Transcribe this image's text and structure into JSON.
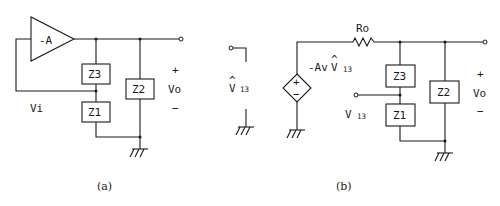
{
  "figure_a": {
    "caption": "(a)",
    "amplifier_label": "-A",
    "impedances": {
      "z3": "Z3",
      "z1": "Z1",
      "z2": "Z2"
    },
    "input_voltage_label": "Vi",
    "output": {
      "plus": "+",
      "label": "Vo",
      "minus": "−"
    }
  },
  "figure_b": {
    "caption": "(b)",
    "probe": {
      "hat": "^",
      "main": "V",
      "sub": "13"
    },
    "source": {
      "label_prefix": "-Av",
      "hat": "^",
      "main": "V",
      "sub": "13",
      "plus": "+",
      "minus": "−"
    },
    "resistor_label": "Ro",
    "impedances": {
      "z3": "Z3",
      "z1": "Z1",
      "z2": "Z2"
    },
    "node_label": {
      "main": "V",
      "sub": "13"
    },
    "output": {
      "plus": "+",
      "label": "Vo",
      "minus": "−"
    }
  }
}
